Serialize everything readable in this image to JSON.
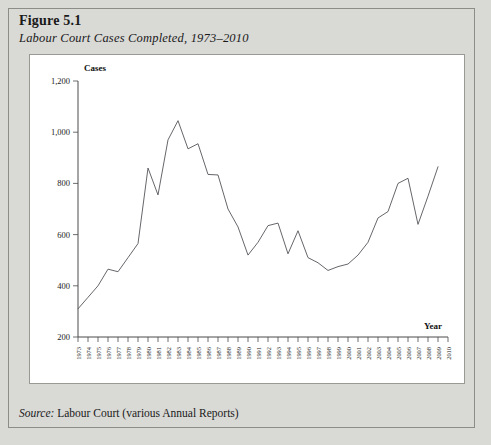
{
  "figure": {
    "number": "Figure 5.1",
    "caption": "Labour Court Cases Completed, 1973–2010",
    "source": "Labour Court (various Annual Reports)",
    "source_label": "Source:"
  },
  "chart_data": {
    "type": "line",
    "title": "Labour Court Cases Completed, 1973–2010",
    "xlabel": "Year",
    "ylabel": "Cases",
    "ylim": [
      200,
      1200
    ],
    "ytick_labels": [
      "1,200",
      "1,000",
      "800",
      "600",
      "400",
      "200"
    ],
    "ytick_values": [
      1200,
      1000,
      800,
      600,
      400,
      200
    ],
    "grid": false,
    "legend": "none",
    "x": [
      1973,
      1974,
      1975,
      1976,
      1977,
      1978,
      1979,
      1980,
      1981,
      1982,
      1983,
      1984,
      1985,
      1986,
      1987,
      1988,
      1989,
      1990,
      1991,
      1992,
      1993,
      1994,
      1995,
      1996,
      1997,
      1998,
      1999,
      2000,
      2001,
      2002,
      2003,
      2004,
      2005,
      2006,
      2007,
      2008,
      2009,
      2010
    ],
    "xtick_labels": [
      "1973",
      "1974",
      "1975",
      "1976",
      "1977",
      "1978",
      "1979",
      "1980",
      "1981",
      "1982",
      "1983",
      "1984",
      "1985",
      "1986",
      "1987",
      "1988",
      "1989",
      "1990",
      "1991",
      "1992",
      "1993",
      "1994",
      "1995",
      "1996",
      "1997",
      "1998",
      "1999",
      "2000",
      "2001",
      "2002",
      "2003",
      "2004",
      "2005",
      "2006",
      "2007",
      "2008",
      "2009",
      "2010"
    ],
    "values": [
      310,
      355,
      400,
      465,
      455,
      510,
      565,
      860,
      755,
      970,
      1045,
      935,
      955,
      835,
      833,
      700,
      630,
      520,
      570,
      635,
      645,
      525,
      615,
      510,
      490,
      460,
      475,
      485,
      520,
      570,
      665,
      690,
      800,
      820,
      640,
      750,
      865,
      null
    ],
    "series": [
      {
        "name": "Cases completed",
        "values": [
          310,
          355,
          400,
          465,
          455,
          510,
          565,
          860,
          755,
          970,
          1045,
          935,
          955,
          835,
          833,
          700,
          630,
          520,
          570,
          635,
          645,
          525,
          615,
          510,
          490,
          460,
          475,
          485,
          520,
          570,
          665,
          690,
          800,
          820,
          640,
          750,
          865,
          null
        ],
        "color": "#55555a"
      }
    ]
  }
}
